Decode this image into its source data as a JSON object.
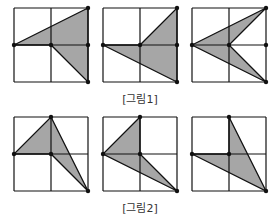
{
  "figures": [
    {
      "label": "[그림1]"
    },
    {
      "label": "[그림2]"
    }
  ],
  "colors": {
    "fill": "#a6a6a6",
    "stroke": "#111111",
    "background": "#ffffff"
  },
  "grids": [
    {
      "x": 14,
      "y": 8,
      "shape": [
        [
          0,
          1
        ],
        [
          2,
          0
        ],
        [
          2,
          2
        ],
        [
          1,
          1
        ]
      ],
      "extra": [
        [
          1,
          1
        ],
        [
          2,
          1
        ]
      ],
      "dots": [
        [
          0,
          1
        ],
        [
          1,
          1
        ],
        [
          2,
          0
        ],
        [
          2,
          1
        ],
        [
          2,
          2
        ]
      ]
    },
    {
      "x": 103,
      "y": 8,
      "shape": [
        [
          0,
          1
        ],
        [
          1,
          1
        ],
        [
          2,
          0
        ],
        [
          2,
          2
        ]
      ],
      "dots": [
        [
          0,
          1
        ],
        [
          1,
          1
        ],
        [
          2,
          0
        ],
        [
          2,
          1
        ],
        [
          2,
          2
        ]
      ]
    },
    {
      "x": 192,
      "y": 8,
      "shape": [
        [
          0,
          1
        ],
        [
          2,
          0
        ],
        [
          1,
          1
        ],
        [
          2,
          2
        ]
      ],
      "dots": [
        [
          0,
          1
        ],
        [
          1,
          1
        ],
        [
          2,
          0
        ],
        [
          2,
          1
        ],
        [
          2,
          2
        ]
      ]
    },
    {
      "x": 14,
      "y": 117,
      "shape": [
        [
          1,
          0
        ],
        [
          2,
          2
        ],
        [
          1,
          1
        ],
        [
          0,
          1
        ]
      ],
      "dots": [
        [
          1,
          0
        ],
        [
          0,
          1
        ],
        [
          1,
          1
        ],
        [
          2,
          2
        ]
      ]
    },
    {
      "x": 103,
      "y": 117,
      "shape": [
        [
          1,
          0
        ],
        [
          0,
          1
        ],
        [
          2,
          2
        ],
        [
          1,
          1
        ]
      ],
      "dots": [
        [
          1,
          0
        ],
        [
          0,
          1
        ],
        [
          1,
          1
        ],
        [
          2,
          2
        ]
      ]
    },
    {
      "x": 192,
      "y": 117,
      "shape": [
        [
          1,
          0
        ],
        [
          2,
          2
        ],
        [
          0,
          1
        ],
        [
          1,
          1
        ]
      ],
      "dots": [
        [
          1,
          0
        ],
        [
          0,
          1
        ],
        [
          1,
          1
        ],
        [
          2,
          2
        ]
      ]
    }
  ]
}
